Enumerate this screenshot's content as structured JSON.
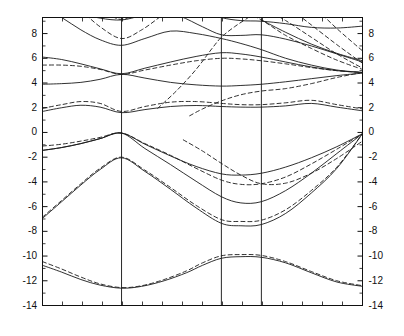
{
  "figure": {
    "title": "",
    "background_color": "#ffffff",
    "line_color": "#1a1a1a"
  },
  "chart_data": {
    "type": "line",
    "title": "",
    "subtitle": "",
    "xlabel": "",
    "ylabel": "",
    "xlim": [
      0,
      1
    ],
    "ylim": [
      -14,
      9.3
    ],
    "grid": false,
    "legend_position": "none",
    "y_ticks": [
      8,
      6,
      4,
      2,
      0,
      -2,
      -4,
      -6,
      -8,
      -10,
      -12,
      -14
    ],
    "y_tick_labels_left": [
      "8",
      "6",
      "4",
      "2",
      "0",
      "-2",
      "-4",
      "-6",
      "-8",
      "-10",
      "-12",
      "-14"
    ],
    "y_tick_labels_right": [
      "8",
      "6",
      "4",
      "2",
      "0",
      "-2",
      "-4",
      "-6",
      "-8",
      "-10",
      "-12",
      "-14"
    ],
    "y_minor_tick_step": 1,
    "x_minor_ticks": [
      0.0625,
      0.125,
      0.1875,
      0.25,
      0.3125,
      0.375,
      0.4375,
      0.5,
      0.5625,
      0.625,
      0.6875,
      0.75,
      0.8125,
      0.875,
      0.9375
    ],
    "x_symmetry_lines": [
      0.247,
      0.559,
      0.684
    ],
    "x_tick_labels": [],
    "series_styles": {
      "solid": {
        "dash": "none",
        "width": 0.9
      },
      "dashed": {
        "dash": "4,3",
        "width": 0.9
      }
    },
    "series": [
      {
        "name": "solid-band-1",
        "style": "solid",
        "x": [
          0.0,
          0.06,
          0.12,
          0.18,
          0.247,
          0.31,
          0.38,
          0.45,
          0.5,
          0.559,
          0.62,
          0.684,
          0.76,
          0.84,
          0.92,
          1.0
        ],
        "values": [
          -10.75,
          -11.3,
          -11.9,
          -12.35,
          -12.6,
          -12.45,
          -12.0,
          -11.35,
          -10.75,
          -10.18,
          -10.05,
          -10.1,
          -10.55,
          -11.35,
          -12.1,
          -12.45
        ]
      },
      {
        "name": "dashed-band-1",
        "style": "dashed",
        "x": [
          0.0,
          0.06,
          0.12,
          0.18,
          0.247,
          0.31,
          0.38,
          0.45,
          0.5,
          0.559,
          0.62,
          0.684,
          0.76,
          0.84,
          0.92,
          1.0
        ],
        "values": [
          -10.45,
          -11.05,
          -11.7,
          -12.25,
          -12.55,
          -12.4,
          -11.9,
          -11.2,
          -10.55,
          -9.98,
          -9.88,
          -9.95,
          -10.45,
          -11.25,
          -12.0,
          -12.4
        ]
      },
      {
        "name": "solid-band-2",
        "style": "solid",
        "x": [
          0.0,
          0.06,
          0.12,
          0.18,
          0.247,
          0.32,
          0.4,
          0.48,
          0.559,
          0.62,
          0.684,
          0.76,
          0.84,
          0.92,
          1.0
        ],
        "values": [
          -6.95,
          -5.6,
          -4.25,
          -3.0,
          -2.05,
          -3.15,
          -4.6,
          -6.1,
          -7.35,
          -7.55,
          -7.45,
          -6.55,
          -4.9,
          -2.9,
          -0.1
        ]
      },
      {
        "name": "dashed-band-2",
        "style": "dashed",
        "x": [
          0.0,
          0.06,
          0.12,
          0.18,
          0.247,
          0.32,
          0.4,
          0.48,
          0.559,
          0.62,
          0.684,
          0.76,
          0.84,
          0.92,
          1.0
        ],
        "values": [
          -6.85,
          -5.5,
          -4.15,
          -2.9,
          -2.0,
          -3.05,
          -4.45,
          -5.9,
          -7.05,
          -7.2,
          -7.1,
          -6.25,
          -4.7,
          -2.8,
          -0.1
        ]
      },
      {
        "name": "solid-band-3",
        "style": "solid",
        "x": [
          0.0,
          0.06,
          0.12,
          0.18,
          0.247,
          0.32,
          0.4,
          0.48,
          0.559,
          0.62,
          0.684,
          0.76,
          0.84,
          0.92,
          1.0
        ],
        "values": [
          -1.45,
          -1.22,
          -0.9,
          -0.5,
          -0.05,
          -0.95,
          -1.9,
          -2.75,
          -3.35,
          -3.45,
          -3.3,
          -2.8,
          -2.05,
          -1.15,
          -0.1
        ]
      },
      {
        "name": "dashed-band-3",
        "style": "dashed",
        "x": [
          0.0,
          0.06,
          0.12,
          0.18,
          0.247,
          0.32,
          0.4,
          0.48,
          0.559,
          0.62,
          0.684,
          0.76,
          0.84,
          0.92,
          1.0
        ],
        "values": [
          -1.1,
          -0.95,
          -0.7,
          -0.4,
          -0.05,
          -0.9,
          -1.85,
          -2.9,
          -3.85,
          -4.2,
          -4.15,
          -3.6,
          -2.55,
          -1.35,
          -0.1
        ]
      },
      {
        "name": "solid-band-4",
        "style": "solid",
        "x": [
          0.0,
          0.06,
          0.12,
          0.18,
          0.247,
          0.32,
          0.4,
          0.48,
          0.559,
          0.62,
          0.684,
          0.76,
          0.84,
          0.92,
          1.0
        ],
        "values": [
          -1.45,
          -1.22,
          -0.9,
          -0.5,
          -0.05,
          -1.3,
          -2.6,
          -3.95,
          -5.2,
          -5.7,
          -5.6,
          -4.7,
          -3.3,
          -1.7,
          -0.1
        ]
      },
      {
        "name": "solid-band-5",
        "style": "solid",
        "x": [
          0.0,
          0.06,
          0.12,
          0.18,
          0.247,
          0.32,
          0.4,
          0.48,
          0.559,
          0.62,
          0.684,
          0.76,
          0.84,
          0.92,
          1.0
        ],
        "values": [
          1.7,
          2.0,
          2.2,
          2.05,
          1.6,
          1.85,
          2.1,
          2.18,
          2.1,
          2.05,
          2.05,
          2.15,
          2.35,
          2.05,
          1.75
        ]
      },
      {
        "name": "dashed-band-5",
        "style": "dashed",
        "x": [
          0.0,
          0.06,
          0.12,
          0.18,
          0.247,
          0.32,
          0.4,
          0.48,
          0.559,
          0.62,
          0.684,
          0.76,
          0.84,
          0.92,
          1.0
        ],
        "values": [
          1.95,
          2.25,
          2.5,
          2.35,
          1.7,
          2.1,
          2.45,
          2.5,
          2.35,
          2.25,
          2.25,
          2.4,
          2.6,
          2.25,
          1.9
        ]
      },
      {
        "name": "solid-band-6",
        "style": "solid",
        "x": [
          0.0,
          0.06,
          0.12,
          0.18,
          0.247,
          0.32,
          0.4,
          0.48,
          0.559,
          0.62,
          0.684,
          0.76,
          0.84,
          0.92,
          1.0
        ],
        "values": [
          3.9,
          3.95,
          4.05,
          4.3,
          4.7,
          4.4,
          4.05,
          3.85,
          3.75,
          3.8,
          3.9,
          4.1,
          4.35,
          4.6,
          4.8
        ]
      },
      {
        "name": "solid-band-7",
        "style": "solid",
        "x": [
          0.0,
          0.06,
          0.12,
          0.18,
          0.247,
          0.32,
          0.4,
          0.48,
          0.559,
          0.62,
          0.684,
          0.76,
          0.84,
          0.92,
          1.0
        ],
        "values": [
          6.1,
          5.9,
          5.55,
          5.15,
          4.75,
          5.2,
          5.7,
          6.15,
          6.45,
          6.35,
          6.1,
          5.7,
          5.3,
          5.0,
          4.85
        ]
      },
      {
        "name": "dashed-band-7",
        "style": "dashed",
        "x": [
          0.0,
          0.06,
          0.12,
          0.18,
          0.247,
          0.32,
          0.4,
          0.48,
          0.559,
          0.62,
          0.684,
          0.76,
          0.84,
          0.92,
          1.0
        ],
        "values": [
          5.45,
          5.45,
          5.35,
          5.1,
          4.7,
          5.05,
          5.45,
          5.8,
          6.0,
          5.95,
          5.8,
          5.55,
          5.25,
          5.0,
          4.85
        ]
      },
      {
        "name": "solid-band-8",
        "style": "solid",
        "x": [
          0.0,
          0.06,
          0.12,
          0.18,
          0.247,
          0.32,
          0.4,
          0.48,
          0.559,
          0.62,
          0.684,
          0.76,
          0.84,
          0.92,
          1.0
        ],
        "values": [
          10.2,
          9.3,
          8.3,
          7.5,
          7.05,
          7.6,
          8.2,
          8.0,
          7.6,
          7.2,
          6.7,
          6.0,
          5.45,
          5.05,
          4.85
        ]
      },
      {
        "name": "solid-band-9",
        "style": "solid",
        "x": [
          0.0,
          0.05,
          0.11,
          0.18,
          0.247,
          0.31,
          0.37,
          0.43,
          0.5,
          0.559,
          0.62,
          0.684,
          0.76,
          0.84,
          0.92,
          1.0
        ],
        "values": [
          11.5,
          10.6,
          9.7,
          9.25,
          9.1,
          9.45,
          9.7,
          9.4,
          8.55,
          7.9,
          7.85,
          7.9,
          7.55,
          7.0,
          6.35,
          5.7
        ]
      },
      {
        "name": "dashed-band-9",
        "style": "dashed",
        "x": [
          0.12,
          0.18,
          0.247,
          0.31,
          0.37,
          0.43
        ],
        "values": [
          9.9,
          8.55,
          7.6,
          8.3,
          9.4,
          10.5
        ]
      },
      {
        "name": "dashed-band-10",
        "style": "dashed",
        "x": [
          0.44,
          0.5,
          0.559,
          0.62,
          0.684,
          0.76,
          0.84,
          0.92,
          1.0
        ],
        "values": [
          -0.6,
          -1.5,
          -2.5,
          -3.45,
          -4.15,
          -4.1,
          -3.3,
          -2.1,
          -0.7
        ]
      },
      {
        "name": "dashed-band-11",
        "style": "dashed",
        "x": [
          0.46,
          0.5,
          0.559,
          0.62,
          0.684,
          0.76,
          0.84,
          0.92,
          1.0
        ],
        "values": [
          1.35,
          1.9,
          2.55,
          3.05,
          3.35,
          3.55,
          3.95,
          4.45,
          4.85
        ]
      },
      {
        "name": "dashed-band-12",
        "style": "dashed",
        "x": [
          0.36,
          0.42,
          0.48,
          0.53,
          0.559,
          0.6,
          0.65,
          0.684
        ],
        "values": [
          1.95,
          3.4,
          5.1,
          6.8,
          7.7,
          8.55,
          9.4,
          9.9
        ]
      },
      {
        "name": "dashed-band-13",
        "style": "dashed",
        "x": [
          0.62,
          0.684,
          0.76,
          0.84,
          0.92,
          1.0
        ],
        "values": [
          9.9,
          9.1,
          7.85,
          6.8,
          5.85,
          5.1
        ]
      },
      {
        "name": "dashed-band-14",
        "style": "dashed",
        "x": [
          0.7,
          0.76,
          0.84,
          0.92,
          1.0
        ],
        "values": [
          9.9,
          9.05,
          7.7,
          6.35,
          5.2
        ]
      },
      {
        "name": "dashed-band-15",
        "style": "dashed",
        "x": [
          0.78,
          0.84,
          0.92,
          1.0
        ],
        "values": [
          9.9,
          8.7,
          7.1,
          5.6
        ]
      },
      {
        "name": "dashed-band-16",
        "style": "dashed",
        "x": [
          0.86,
          0.92,
          1.0
        ],
        "values": [
          9.9,
          8.4,
          6.6
        ]
      },
      {
        "name": "solid-band-10",
        "style": "solid",
        "x": [
          0.684,
          0.76,
          0.84,
          0.92,
          1.0
        ],
        "values": [
          9.1,
          8.1,
          7.15,
          6.4,
          5.8
        ]
      },
      {
        "name": "solid-band-11",
        "style": "solid",
        "x": [
          0.5,
          0.559,
          0.62,
          0.684,
          0.76,
          0.84,
          0.92,
          1.0
        ],
        "values": [
          9.9,
          9.3,
          9.05,
          9.0,
          8.8,
          8.5,
          8.45,
          8.6
        ]
      },
      {
        "name": "solid-band-12",
        "style": "solid",
        "x": [
          0.247,
          0.3,
          0.36,
          0.42,
          0.48,
          0.53
        ],
        "values": [
          9.55,
          9.75,
          9.9,
          9.9,
          9.9,
          9.9
        ]
      },
      {
        "name": "dashed-band-17",
        "style": "dashed",
        "x": [
          0.18,
          0.22,
          0.247,
          0.28,
          0.32
        ],
        "values": [
          9.9,
          9.35,
          9.15,
          9.4,
          9.9
        ]
      },
      {
        "name": "dashed-band-18",
        "style": "dashed",
        "x": [
          0.0,
          0.05,
          0.1,
          0.14
        ],
        "values": [
          9.3,
          9.55,
          9.8,
          9.9
        ]
      }
    ]
  },
  "axes": {
    "frame_color": "#111111",
    "tick_direction": "in",
    "left_labels": [
      "8",
      "6",
      "4",
      "2",
      "0",
      "-2",
      "-4",
      "-6",
      "-8",
      "-10",
      "-12",
      "-14"
    ],
    "right_labels": [
      "8",
      "6",
      "4",
      "2",
      "0",
      "-2",
      "-4",
      "-6",
      "-8",
      "-10",
      "-12",
      "-14"
    ]
  }
}
